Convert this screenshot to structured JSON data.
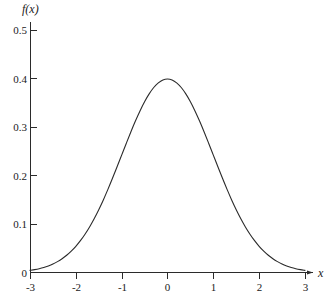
{
  "chart_data": {
    "type": "line",
    "title": "",
    "subtitle": "",
    "xlabel": "x",
    "ylabel": "f(x)",
    "xlim": [
      -3,
      3
    ],
    "ylim": [
      0,
      0.5
    ],
    "grid": false,
    "legend": false,
    "legend_position": "none",
    "x_ticks": [
      -3,
      -2,
      -1,
      0,
      1,
      2,
      3
    ],
    "x_tick_labels": [
      "-3",
      "-2",
      "-1",
      "0",
      "1",
      "2",
      "3"
    ],
    "y_ticks": [
      0,
      0.1,
      0.2,
      0.3,
      0.4,
      0.5
    ],
    "y_tick_labels": [
      "0",
      "0.1",
      "0.2",
      "0.3",
      "0.4",
      "0.5"
    ],
    "series": [
      {
        "name": "standard normal density",
        "color": "#2b2b2b",
        "x": [
          -3,
          -2.9,
          -2.8,
          -2.7,
          -2.6,
          -2.5,
          -2.4,
          -2.3,
          -2.2,
          -2.1,
          -2,
          -1.9,
          -1.8,
          -1.7,
          -1.6,
          -1.5,
          -1.4,
          -1.3,
          -1.2,
          -1.1,
          -1,
          -0.9,
          -0.8,
          -0.7,
          -0.6,
          -0.5,
          -0.4,
          -0.3,
          -0.2,
          -0.1,
          0,
          0.1,
          0.2,
          0.3,
          0.4,
          0.5,
          0.6,
          0.7,
          0.8,
          0.9,
          1,
          1.1,
          1.2,
          1.3,
          1.4,
          1.5,
          1.6,
          1.7,
          1.8,
          1.9,
          2,
          2.1,
          2.2,
          2.3,
          2.4,
          2.5,
          2.6,
          2.7,
          2.8,
          2.9,
          3
        ],
        "values": [
          0.0044,
          0.006,
          0.0079,
          0.0104,
          0.0136,
          0.0175,
          0.0224,
          0.0283,
          0.0355,
          0.044,
          0.054,
          0.0656,
          0.079,
          0.094,
          0.1109,
          0.1295,
          0.1497,
          0.1714,
          0.1942,
          0.2179,
          0.242,
          0.2661,
          0.2897,
          0.3123,
          0.3332,
          0.3521,
          0.3683,
          0.3814,
          0.391,
          0.397,
          0.3989,
          0.397,
          0.391,
          0.3814,
          0.3683,
          0.3521,
          0.3332,
          0.3123,
          0.2897,
          0.2661,
          0.242,
          0.2179,
          0.1942,
          0.1714,
          0.1497,
          0.1295,
          0.1109,
          0.094,
          0.079,
          0.0656,
          0.054,
          0.044,
          0.0355,
          0.0283,
          0.0224,
          0.0175,
          0.0136,
          0.0104,
          0.0079,
          0.006,
          0.0044
        ]
      }
    ],
    "annotations": [],
    "peak": {
      "x": 0,
      "y": 0.3989
    }
  },
  "geometry": {
    "x_origin_px": 30,
    "y_baseline_px": 272.5,
    "px_per_x_unit": 45.83,
    "px_per_y_unit": 485,
    "x_axis_end_px": 313,
    "y_axis_top_px": 22
  },
  "labels": {
    "y_axis_name": "f(x)",
    "x_axis_name": "x"
  }
}
